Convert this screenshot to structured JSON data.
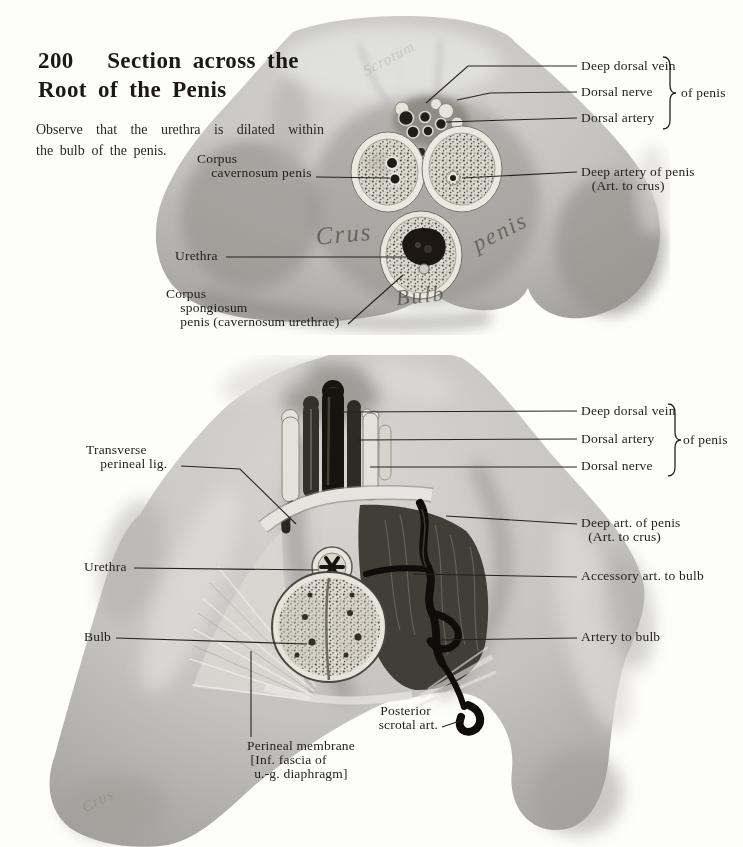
{
  "page": {
    "title": "200   Section across the\nRoot of the Penis",
    "subtitle": "Observe  that  the  urethra  is  dilated  within\nthe bulb of the penis."
  },
  "colors": {
    "ink": "#24211c",
    "paper": "#fdfdfb"
  },
  "figure_top": {
    "labels": {
      "corpus_cavernosum": "Corpus\n    cavernosum penis",
      "urethra": "Urethra",
      "corpus_spongiosum": "Corpus\n    spongiosum\n    penis (cavernosum urethrae)",
      "deep_dorsal_vein": "Deep dorsal vein",
      "dorsal_nerve": "Dorsal nerve",
      "dorsal_artery": "Dorsal artery",
      "of_penis": "of penis",
      "deep_artery_of_penis": "Deep artery of penis\n   (Art. to crus)"
    },
    "inline_text": {
      "crus": "Crus",
      "penis": "penis",
      "bulb": "Bulb",
      "faint_script": "Scrotum"
    }
  },
  "figure_bottom": {
    "labels": {
      "transverse_perineal_lig": "Transverse\n    perineal lig.",
      "urethra": "Urethra",
      "bulb": "Bulb",
      "deep_dorsal_vein": "Deep dorsal vein",
      "dorsal_artery": "Dorsal artery",
      "dorsal_nerve": "Dorsal nerve",
      "of_penis": "of penis",
      "deep_art_of_penis": "Deep art. of penis\n  (Art. to crus)",
      "accessory_art_to_bulb": "Accessory art. to bulb",
      "artery_to_bulb": "Artery to bulb",
      "posterior_scrotal_art": "Posterior  \nscrotal art.",
      "perineal_membrane": "Perineal membrane\n [Inf. fascia of\n  u.-g. diaphragm]"
    },
    "inline_text": {
      "faint_script": "Crus"
    }
  }
}
